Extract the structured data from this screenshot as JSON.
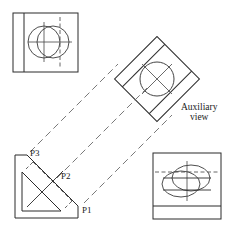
{
  "drawing": {
    "title": "Auxiliary view projection - orthographic engineering drawing",
    "sheet": {
      "width": 232,
      "height": 229,
      "background": "#ffffff"
    },
    "line_style": {
      "visible_color": "#2b2b2b",
      "hidden_color": "#555555",
      "center_color": "#444444",
      "projection_color": "#666666",
      "visible_width": 1.0,
      "thin_width": 0.7
    },
    "labels": {
      "auxiliary_line1": "Auxiliary",
      "auxiliary_line2": "view",
      "point1": "P1",
      "point2": "P2",
      "point3": "P3"
    },
    "views": [
      {
        "name": "top-left-view",
        "kind": "front-view",
        "rect": {
          "x": 13,
          "y": 13,
          "w": 65,
          "h": 59
        },
        "interior_vertical_solid_x": 24,
        "circles": [
          {
            "cx": 44,
            "cy": 42,
            "r": 16
          },
          {
            "cx": 53,
            "cy": 42,
            "r": 16
          }
        ],
        "center_vertical_solid_x": 44,
        "center_vertical_dashed_x": 60,
        "center_horizontal_y": 42
      },
      {
        "name": "auxiliary-view",
        "kind": "auxiliary-view",
        "rotation_deg": -45,
        "square": {
          "cx": 157,
          "cy": 79,
          "half": 42
        },
        "circle": {
          "cx": 157,
          "cy": 79,
          "r": 17
        },
        "label_x": 182,
        "label_y": 110
      },
      {
        "name": "bottom-left-view",
        "kind": "side-view",
        "outline_points": "15,155 27,155 78,206 78,218 15,218",
        "inclined_face": "27,155 78,206",
        "inner_points": "22,172 22,211 61,211",
        "hidden_face": "35,164 70,199",
        "points": {
          "P1": {
            "x": 78,
            "y": 206,
            "label_x": 82,
            "label_y": 212
          },
          "P2": {
            "x": 53,
            "y": 181,
            "label_x": 62,
            "label_y": 177
          },
          "P3": {
            "x": 27,
            "y": 155,
            "label_x": 31,
            "label_y": 155
          }
        }
      },
      {
        "name": "bottom-right-view",
        "kind": "top-view",
        "rect": {
          "x": 153,
          "y": 153,
          "w": 68,
          "h": 66
        },
        "bottom_band_y": 206,
        "ellipses": [
          {
            "cx": 181,
            "cy": 184,
            "rx": 19,
            "ry": 13
          },
          {
            "cx": 191,
            "cy": 178,
            "rx": 19,
            "ry": 13
          }
        ],
        "center_vertical_x": 187,
        "dashed_horizontal_y": 172,
        "solid_horizontal_top_y": 178,
        "solid_horizontal_bottom_y": 190
      }
    ],
    "projection_lines": [
      {
        "name": "proj-p3-upper",
        "x1": 30,
        "y1": 152,
        "x2": 118,
        "y2": 64
      },
      {
        "name": "proj-p2-middle",
        "x1": 57,
        "y1": 178,
        "x2": 147,
        "y2": 88
      },
      {
        "name": "proj-p1-lower",
        "x1": 84,
        "y1": 203,
        "x2": 172,
        "y2": 115
      }
    ]
  }
}
